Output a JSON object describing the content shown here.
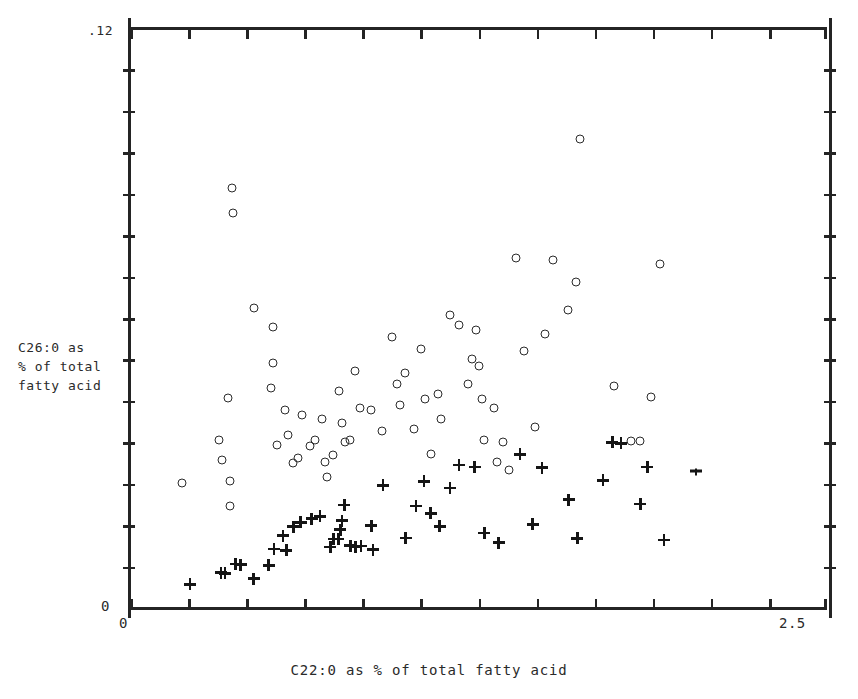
{
  "figure": {
    "axes": {
      "y_max_label": ".12",
      "y_min_label": "0",
      "x_min_label": "0",
      "x_max_label": "2.5",
      "y_title": "C26:0 as\n% of total\nfatty acid",
      "x_title": "C22:0 as % of total fatty acid"
    }
  },
  "chart_data": {
    "type": "scatter",
    "title": "",
    "xlabel": "C22:0 as % of total fatty acid",
    "ylabel": "C26:0 as % of total fatty acid",
    "xlim": [
      0,
      2.5
    ],
    "ylim": [
      0,
      0.12
    ],
    "xticks": [
      0,
      2.5
    ],
    "yticks": [
      0,
      0.12
    ],
    "grid": false,
    "legend": null,
    "frame": "box-with-ticks-all-sides",
    "series": [
      {
        "name": "open-circle-group",
        "marker": "open-circle",
        "color": "#2b2b2b",
        "points": [
          [
            0.185,
            0.0259
          ],
          [
            0.358,
            0.0262
          ],
          [
            0.357,
            0.0212
          ],
          [
            0.319,
            0.0348
          ],
          [
            0.329,
            0.0306
          ],
          [
            0.35,
            0.0435
          ],
          [
            0.368,
            0.0817
          ],
          [
            0.366,
            0.0869
          ],
          [
            0.446,
            0.0621
          ],
          [
            0.505,
            0.0455
          ],
          [
            0.513,
            0.0581
          ],
          [
            0.512,
            0.0506
          ],
          [
            0.527,
            0.0337
          ],
          [
            0.556,
            0.041
          ],
          [
            0.568,
            0.0357
          ],
          [
            0.583,
            0.03
          ],
          [
            0.602,
            0.0311
          ],
          [
            0.617,
            0.0399
          ],
          [
            0.646,
            0.0336
          ],
          [
            0.663,
            0.0348
          ],
          [
            0.687,
            0.0392
          ],
          [
            0.7,
            0.0302
          ],
          [
            0.706,
            0.0271
          ],
          [
            0.727,
            0.0316
          ],
          [
            0.75,
            0.0449
          ],
          [
            0.76,
            0.0382
          ],
          [
            0.772,
            0.0343
          ],
          [
            0.79,
            0.0348
          ],
          [
            0.806,
            0.049
          ],
          [
            0.826,
            0.0413
          ],
          [
            0.863,
            0.041
          ],
          [
            0.905,
            0.0367
          ],
          [
            0.94,
            0.056
          ],
          [
            0.958,
            0.0463
          ],
          [
            0.968,
            0.0421
          ],
          [
            0.986,
            0.0487
          ],
          [
            1.017,
            0.037
          ],
          [
            1.045,
            0.0536
          ],
          [
            1.059,
            0.0432
          ],
          [
            1.079,
            0.0318
          ],
          [
            1.103,
            0.0443
          ],
          [
            1.117,
            0.0392
          ],
          [
            1.147,
            0.0606
          ],
          [
            1.179,
            0.0585
          ],
          [
            1.212,
            0.0463
          ],
          [
            1.228,
            0.0515
          ],
          [
            1.24,
            0.0576
          ],
          [
            1.253,
            0.05
          ],
          [
            1.262,
            0.0432
          ],
          [
            1.271,
            0.0347
          ],
          [
            1.306,
            0.0414
          ],
          [
            1.318,
            0.0302
          ],
          [
            1.337,
            0.0344
          ],
          [
            1.359,
            0.0285
          ],
          [
            1.386,
            0.0724
          ],
          [
            1.412,
            0.0531
          ],
          [
            1.451,
            0.0375
          ],
          [
            1.489,
            0.0567
          ],
          [
            1.517,
            0.0721
          ],
          [
            1.572,
            0.0617
          ],
          [
            1.598,
            0.0674
          ],
          [
            1.615,
            0.097
          ],
          [
            1.735,
            0.046
          ],
          [
            1.797,
            0.0345
          ],
          [
            1.829,
            0.0345
          ],
          [
            1.869,
            0.0437
          ],
          [
            1.9,
            0.0712
          ]
        ]
      },
      {
        "name": "plus-group",
        "marker": "plus",
        "color": "#151515",
        "points": [
          [
            0.215,
            0.0049
          ],
          [
            0.326,
            0.0073
          ],
          [
            0.341,
            0.0072
          ],
          [
            0.379,
            0.0091
          ],
          [
            0.397,
            0.009
          ],
          [
            0.443,
            0.0061
          ],
          [
            0.497,
            0.0088
          ],
          [
            0.517,
            0.0122
          ],
          [
            0.549,
            0.015
          ],
          [
            0.561,
            0.0119
          ],
          [
            0.586,
            0.0168
          ],
          [
            0.612,
            0.0177
          ],
          [
            0.652,
            0.0185
          ],
          [
            0.681,
            0.019
          ],
          [
            0.718,
            0.0126
          ],
          [
            0.73,
            0.0143
          ],
          [
            0.747,
            0.0143
          ],
          [
            0.754,
            0.0162
          ],
          [
            0.76,
            0.0181
          ],
          [
            0.769,
            0.0213
          ],
          [
            0.79,
            0.0129
          ],
          [
            0.81,
            0.0127
          ],
          [
            0.829,
            0.0128
          ],
          [
            0.866,
            0.017
          ],
          [
            0.872,
            0.0121
          ],
          [
            0.908,
            0.0254
          ],
          [
            0.989,
            0.0145
          ],
          [
            1.026,
            0.0211
          ],
          [
            1.055,
            0.0262
          ],
          [
            1.079,
            0.0196
          ],
          [
            1.111,
            0.0169
          ],
          [
            1.148,
            0.0248
          ],
          [
            1.18,
            0.0296
          ],
          [
            1.236,
            0.0292
          ],
          [
            1.271,
            0.0155
          ],
          [
            1.322,
            0.0135
          ],
          [
            1.399,
            0.0318
          ],
          [
            1.444,
            0.0173
          ],
          [
            1.478,
            0.029
          ],
          [
            1.574,
            0.0224
          ],
          [
            1.605,
            0.0144
          ],
          [
            1.697,
            0.0264
          ],
          [
            1.73,
            0.0343
          ],
          [
            1.761,
            0.0341
          ],
          [
            1.83,
            0.0215
          ],
          [
            1.856,
            0.0292
          ],
          [
            1.915,
            0.0141
          ]
        ]
      },
      {
        "name": "plus-clipped-right-edge",
        "marker": "plus-half",
        "color": "#151515",
        "points": [
          [
            2.03,
            0.0281
          ]
        ]
      }
    ]
  }
}
